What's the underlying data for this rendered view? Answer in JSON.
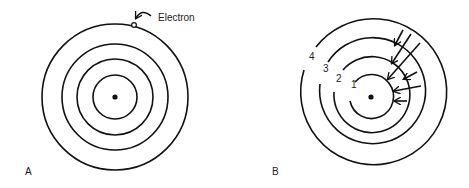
{
  "panels": [
    {
      "id": "A",
      "label": "A",
      "center": [
        115,
        97
      ],
      "orbit_radii": [
        22,
        38,
        53,
        73
      ],
      "electron": {
        "label": "Electron",
        "position": [
          134,
          24
        ]
      }
    },
    {
      "id": "B",
      "label": "B",
      "center": [
        371,
        97
      ],
      "orbit_radii": [
        22,
        38,
        53,
        73
      ],
      "orbit_labels": [
        "1",
        "2",
        "3",
        "4"
      ]
    }
  ],
  "colors": {
    "stroke": "#111111",
    "background": "#ffffff"
  }
}
